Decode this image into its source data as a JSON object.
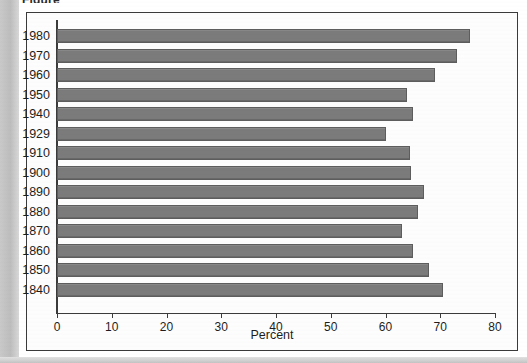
{
  "caption_fragment": "Figure",
  "chart_data": {
    "type": "bar",
    "orientation": "horizontal",
    "title": "",
    "xlabel": "Percent",
    "ylabel": "",
    "categories": [
      "1980",
      "1970",
      "1960",
      "1950",
      "1940",
      "1929",
      "1910",
      "1900",
      "1890",
      "1880",
      "1870",
      "1860",
      "1850",
      "1840"
    ],
    "values": [
      75.4,
      73.0,
      69.0,
      64.0,
      65.0,
      60.0,
      64.5,
      64.6,
      67.0,
      66.0,
      63.0,
      65.0,
      68.0,
      70.5
    ],
    "xlim": [
      0,
      80
    ],
    "xticks": [
      0,
      10,
      20,
      30,
      40,
      50,
      60,
      70,
      80
    ],
    "xticklabels": [
      "0",
      "10",
      "20",
      "30",
      "40",
      "50",
      "60",
      "70",
      "80"
    ],
    "grid": false,
    "legend": false,
    "bar_color": "#7b7b7b",
    "bar_edge_color": "#5d5d5d",
    "axis_color": "#3b3b3b",
    "background_color": "#fdfdfd"
  }
}
